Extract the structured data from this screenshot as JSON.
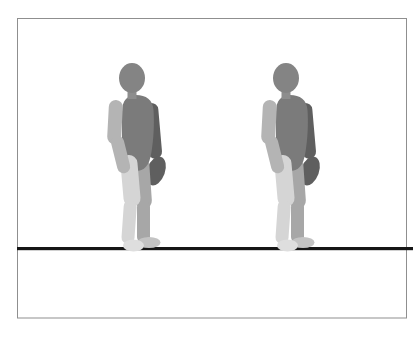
{
  "window": {
    "width_px": 420,
    "height_px": 338,
    "background": "#ffffff"
  },
  "scene": {
    "description": "Two identical gray 3D-style human figures standing side by side, facing right, on a thick black horizontal ground line inside a thin gray rectangular frame on a white background",
    "frame": {
      "border_color": "#8f8f8f"
    },
    "ground_line": {
      "color": "#161616"
    },
    "figures": [
      {
        "name": "person-figure-left",
        "facing": "right",
        "pose": "standing"
      },
      {
        "name": "person-figure-right",
        "facing": "right",
        "pose": "standing"
      }
    ],
    "figure_colors": {
      "head": "#848484",
      "neck": "#8d8d8d",
      "torso": "#7b7b7b",
      "far_arm": "#5f5f5f",
      "near_arm": "#b4b4b4",
      "near_leg": "#d5d5d5",
      "far_leg": "#a7a7a7",
      "near_foot": "#dedede",
      "far_foot": "#c3c3c3"
    }
  }
}
